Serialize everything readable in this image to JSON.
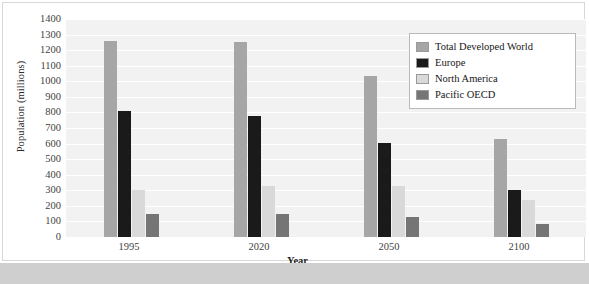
{
  "chart_data": {
    "type": "bar",
    "title": "",
    "xlabel": "Year",
    "ylabel": "Population (millions)",
    "categories": [
      "1995",
      "2020",
      "2050",
      "2100"
    ],
    "ylim": [
      0,
      1400
    ],
    "ytick_step": 100,
    "yticks": [
      "1400",
      "1300",
      "1200",
      "1100",
      "1000",
      "900",
      "800",
      "700",
      "600",
      "500",
      "400",
      "300",
      "200",
      "100",
      "0"
    ],
    "grid": true,
    "legend_position": "top-right",
    "series": [
      {
        "name": "Total Developed World",
        "color": "#a6a6a6",
        "values": [
          1260,
          1255,
          1035,
          630
        ]
      },
      {
        "name": "Europe",
        "color": "#1a1a1a",
        "values": [
          810,
          775,
          605,
          300
        ]
      },
      {
        "name": "North America",
        "color": "#d9d9d9",
        "values": [
          300,
          330,
          325,
          240
        ]
      },
      {
        "name": "Pacific OECD",
        "color": "#757575",
        "values": [
          150,
          145,
          130,
          85
        ]
      }
    ]
  },
  "axes": {
    "y_title": "Population (millions)",
    "x_title": "Year"
  },
  "legend": {
    "items": [
      {
        "label": "Total Developed World",
        "color": "#a6a6a6"
      },
      {
        "label": "Europe",
        "color": "#1a1a1a"
      },
      {
        "label": "North America",
        "color": "#d9d9d9"
      },
      {
        "label": "Pacific OECD",
        "color": "#757575"
      }
    ]
  },
  "colors": {
    "plot_background": "#f2f2f2",
    "page_background": "#ffffff",
    "gridline": "#ffffff",
    "bottom_band": "#cfcfcf",
    "card_border": "#d8d8d8"
  }
}
